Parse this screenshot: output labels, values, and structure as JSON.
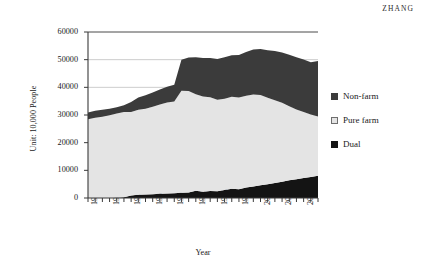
{
  "running_head": "ZHANG",
  "legend": {
    "position": "right",
    "items": [
      {
        "label": "Non-farm",
        "color": "#3b3b3b",
        "border": "#3b3b3b",
        "name": "legend-item-non-farm"
      },
      {
        "label": "Pure farm",
        "color": "#e4e4e4",
        "border": "#6e6e6e",
        "name": "legend-item-pure-farm"
      },
      {
        "label": "Dual",
        "color": "#141414",
        "border": "#141414",
        "name": "legend-item-dual"
      }
    ]
  },
  "chart_data": {
    "type": "area",
    "stacked": true,
    "title": "",
    "xlabel": "Year",
    "ylabel": "Unit: 10,000 People",
    "ylim": [
      0,
      60000
    ],
    "yticks": [
      0,
      10000,
      20000,
      30000,
      40000,
      50000,
      60000
    ],
    "ytick_labels": [
      "0",
      "10000",
      "20000",
      "30000",
      "40000",
      "50000",
      "60000"
    ],
    "grid": "horizontal",
    "xlim": [
      1978,
      2010
    ],
    "x": [
      1978,
      1979,
      1980,
      1981,
      1982,
      1983,
      1984,
      1985,
      1986,
      1987,
      1988,
      1989,
      1990,
      1991,
      1992,
      1993,
      1994,
      1995,
      1996,
      1997,
      1998,
      1999,
      2000,
      2001,
      2002,
      2003,
      2004,
      2005,
      2006,
      2007,
      2008,
      2009,
      2010
    ],
    "xtick_labels": [
      "1978",
      "1981",
      "1984",
      "1987",
      "1990",
      "1993",
      "1996",
      "1999",
      "2002",
      "2005",
      "2008"
    ],
    "xtick_every": 3,
    "xtick_minor": "every year",
    "series": [
      {
        "name": "Dual",
        "color": "#141414",
        "stack_order": 1,
        "values": [
          0,
          0,
          0,
          0,
          100,
          300,
          900,
          1200,
          1300,
          1400,
          1500,
          1600,
          1700,
          1900,
          2000,
          2600,
          2300,
          2500,
          2400,
          2900,
          3300,
          3200,
          3800,
          4200,
          4600,
          5000,
          5400,
          5900,
          6400,
          6800,
          7200,
          7600,
          8000
        ]
      },
      {
        "name": "Pure farm",
        "color": "#e4e4e4",
        "stack_order": 2,
        "values": [
          28500,
          29000,
          29400,
          29900,
          30400,
          30800,
          30200,
          30700,
          31000,
          31600,
          32300,
          32900,
          33200,
          36900,
          36700,
          34900,
          34400,
          33900,
          33100,
          33000,
          33300,
          33100,
          33200,
          33200,
          32600,
          31200,
          29900,
          28500,
          26800,
          25200,
          23900,
          22600,
          21500
        ]
      },
      {
        "name": "Non-farm",
        "color": "#3b3b3b",
        "stack_order": 3,
        "values": [
          2400,
          2500,
          2500,
          2400,
          2300,
          2400,
          3600,
          4400,
          4800,
          5100,
          5400,
          5700,
          6000,
          11200,
          12100,
          13400,
          13900,
          14200,
          14700,
          15000,
          15000,
          15400,
          15800,
          16300,
          16700,
          17200,
          17800,
          18200,
          18600,
          18900,
          19000,
          18900,
          20000
        ]
      }
    ]
  }
}
